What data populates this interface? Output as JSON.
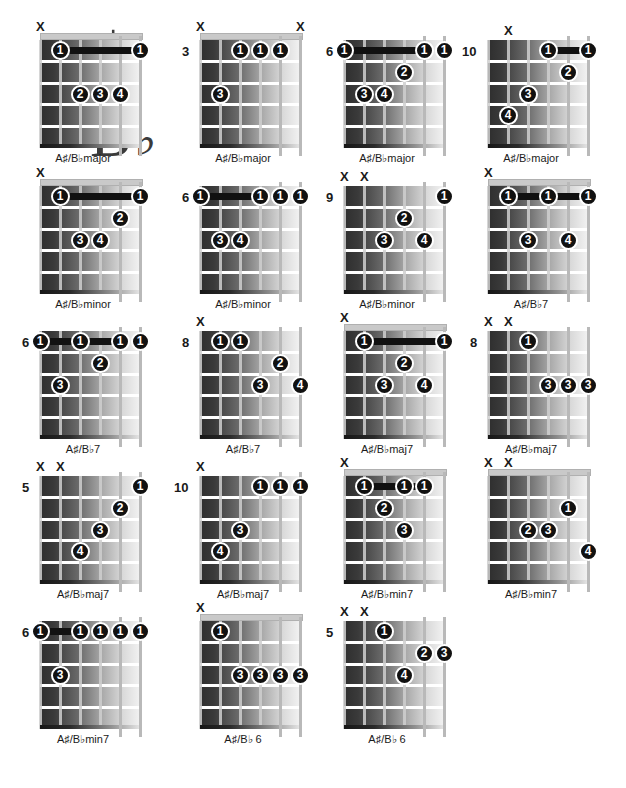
{
  "title": {
    "sharp_letter": "A",
    "sharp_symbol": "♯",
    "flat_letter": "B",
    "flat_symbol": "♭"
  },
  "legend": {
    "mute_marker": "X",
    "mute_icon_name": "string-mute-x-icon"
  },
  "chords": [
    {
      "id": "ab-major-1",
      "name": "A♯/B♭major",
      "fret_label": "",
      "open_position": true,
      "mutes": [
        1
      ],
      "barre": {
        "fret": 1,
        "from_string": 2,
        "to_string": 6
      },
      "dots": [
        {
          "string": 2,
          "fret": 1,
          "finger": "1"
        },
        {
          "string": 6,
          "fret": 1,
          "finger": "1"
        },
        {
          "string": 3,
          "fret": 3,
          "finger": "2"
        },
        {
          "string": 4,
          "fret": 3,
          "finger": "3"
        },
        {
          "string": 5,
          "fret": 3,
          "finger": "4"
        }
      ]
    },
    {
      "id": "ab-major-2",
      "name": "A♯/B♭major",
      "fret_label": "3",
      "open_position": true,
      "mutes": [
        1,
        6
      ],
      "barre": null,
      "dots": [
        {
          "string": 3,
          "fret": 1,
          "finger": "1"
        },
        {
          "string": 4,
          "fret": 1,
          "finger": "1"
        },
        {
          "string": 5,
          "fret": 1,
          "finger": "1"
        },
        {
          "string": 2,
          "fret": 3,
          "finger": "3"
        }
      ]
    },
    {
      "id": "ab-major-3",
      "name": "A♯/B♭major",
      "fret_label": "6",
      "open_position": false,
      "mutes": [],
      "barre": {
        "fret": 1,
        "from_string": 1,
        "to_string": 5
      },
      "dots": [
        {
          "string": 1,
          "fret": 1,
          "finger": "1"
        },
        {
          "string": 5,
          "fret": 1,
          "finger": "1"
        },
        {
          "string": 6,
          "fret": 1,
          "finger": "1"
        },
        {
          "string": 4,
          "fret": 2,
          "finger": "2"
        },
        {
          "string": 2,
          "fret": 3,
          "finger": "3"
        },
        {
          "string": 3,
          "fret": 3,
          "finger": "4"
        }
      ]
    },
    {
      "id": "ab-major-4",
      "name": "A♯/B♭major",
      "fret_label": "10",
      "open_position": false,
      "mutes": [
        2
      ],
      "barre": {
        "fret": 1,
        "from_string": 4,
        "to_string": 6
      },
      "dots": [
        {
          "string": 4,
          "fret": 1,
          "finger": "1"
        },
        {
          "string": 6,
          "fret": 1,
          "finger": "1"
        },
        {
          "string": 5,
          "fret": 2,
          "finger": "2"
        },
        {
          "string": 3,
          "fret": 3,
          "finger": "3"
        },
        {
          "string": 2,
          "fret": 4,
          "finger": "4"
        }
      ]
    },
    {
      "id": "ab-minor-1",
      "name": "A♯/B♭minor",
      "fret_label": "",
      "open_position": true,
      "mutes": [
        1
      ],
      "barre": {
        "fret": 1,
        "from_string": 2,
        "to_string": 6
      },
      "dots": [
        {
          "string": 2,
          "fret": 1,
          "finger": "1"
        },
        {
          "string": 6,
          "fret": 1,
          "finger": "1"
        },
        {
          "string": 5,
          "fret": 2,
          "finger": "2"
        },
        {
          "string": 3,
          "fret": 3,
          "finger": "3"
        },
        {
          "string": 4,
          "fret": 3,
          "finger": "4"
        }
      ]
    },
    {
      "id": "ab-minor-2",
      "name": "A♯/B♭minor",
      "fret_label": "6",
      "open_position": false,
      "mutes": [],
      "barre": {
        "fret": 1,
        "from_string": 1,
        "to_string": 4
      },
      "dots": [
        {
          "string": 1,
          "fret": 1,
          "finger": "1"
        },
        {
          "string": 4,
          "fret": 1,
          "finger": "1"
        },
        {
          "string": 5,
          "fret": 1,
          "finger": "1"
        },
        {
          "string": 6,
          "fret": 1,
          "finger": "1"
        },
        {
          "string": 2,
          "fret": 3,
          "finger": "3"
        },
        {
          "string": 3,
          "fret": 3,
          "finger": "4"
        }
      ]
    },
    {
      "id": "ab-minor-3",
      "name": "A♯/B♭minor",
      "fret_label": "9",
      "open_position": false,
      "mutes": [
        1,
        2
      ],
      "barre": null,
      "dots": [
        {
          "string": 6,
          "fret": 1,
          "finger": "1"
        },
        {
          "string": 4,
          "fret": 2,
          "finger": "2"
        },
        {
          "string": 3,
          "fret": 3,
          "finger": "3"
        },
        {
          "string": 5,
          "fret": 3,
          "finger": "4"
        }
      ]
    },
    {
      "id": "ab-7-1",
      "name": "A♯/B♭7",
      "fret_label": "",
      "open_position": true,
      "mutes": [
        1
      ],
      "barre": {
        "fret": 1,
        "from_string": 2,
        "to_string": 6
      },
      "dots": [
        {
          "string": 2,
          "fret": 1,
          "finger": "1"
        },
        {
          "string": 4,
          "fret": 1,
          "finger": "1"
        },
        {
          "string": 6,
          "fret": 1,
          "finger": "1"
        },
        {
          "string": 3,
          "fret": 3,
          "finger": "3"
        },
        {
          "string": 5,
          "fret": 3,
          "finger": "4"
        }
      ]
    },
    {
      "id": "ab-7-2",
      "name": "A♯/B♭7",
      "fret_label": "6",
      "open_position": false,
      "mutes": [],
      "barre": {
        "fret": 1,
        "from_string": 1,
        "to_string": 5
      },
      "dots": [
        {
          "string": 1,
          "fret": 1,
          "finger": "1"
        },
        {
          "string": 3,
          "fret": 1,
          "finger": "1"
        },
        {
          "string": 5,
          "fret": 1,
          "finger": "1"
        },
        {
          "string": 6,
          "fret": 1,
          "finger": "1"
        },
        {
          "string": 4,
          "fret": 2,
          "finger": "2"
        },
        {
          "string": 2,
          "fret": 3,
          "finger": "3"
        }
      ]
    },
    {
      "id": "ab-7-3",
      "name": "A♯/B♭7",
      "fret_label": "8",
      "open_position": false,
      "mutes": [
        1
      ],
      "barre": null,
      "dots": [
        {
          "string": 2,
          "fret": 1,
          "finger": "1"
        },
        {
          "string": 3,
          "fret": 1,
          "finger": "1"
        },
        {
          "string": 5,
          "fret": 2,
          "finger": "2"
        },
        {
          "string": 4,
          "fret": 3,
          "finger": "3"
        },
        {
          "string": 6,
          "fret": 3,
          "finger": "4"
        }
      ]
    },
    {
      "id": "ab-maj7-1",
      "name": "A♯/B♭maj7",
      "fret_label": "",
      "open_position": true,
      "mutes": [
        1
      ],
      "barre": {
        "fret": 1,
        "from_string": 2,
        "to_string": 6
      },
      "dots": [
        {
          "string": 2,
          "fret": 1,
          "finger": "1"
        },
        {
          "string": 6,
          "fret": 1,
          "finger": "1"
        },
        {
          "string": 4,
          "fret": 2,
          "finger": "2"
        },
        {
          "string": 3,
          "fret": 3,
          "finger": "3"
        },
        {
          "string": 5,
          "fret": 3,
          "finger": "4"
        }
      ]
    },
    {
      "id": "ab-maj7-2",
      "name": "A♯/B♭maj7",
      "fret_label": "8",
      "open_position": false,
      "mutes": [
        1,
        2
      ],
      "barre": null,
      "dots": [
        {
          "string": 3,
          "fret": 1,
          "finger": "1"
        },
        {
          "string": 4,
          "fret": 3,
          "finger": "3"
        },
        {
          "string": 5,
          "fret": 3,
          "finger": "3"
        },
        {
          "string": 6,
          "fret": 3,
          "finger": "3"
        }
      ]
    },
    {
      "id": "ab-maj7-3",
      "name": "A♯/B♭maj7",
      "fret_label": "5",
      "open_position": false,
      "mutes": [
        1,
        2
      ],
      "barre": null,
      "dots": [
        {
          "string": 6,
          "fret": 1,
          "finger": "1"
        },
        {
          "string": 5,
          "fret": 2,
          "finger": "2"
        },
        {
          "string": 4,
          "fret": 3,
          "finger": "3"
        },
        {
          "string": 3,
          "fret": 4,
          "finger": "4"
        }
      ]
    },
    {
      "id": "ab-maj7-4",
      "name": "A♯/B♭maj7",
      "fret_label": "10",
      "open_position": false,
      "mutes": [
        1
      ],
      "barre": null,
      "dots": [
        {
          "string": 4,
          "fret": 1,
          "finger": "1"
        },
        {
          "string": 5,
          "fret": 1,
          "finger": "1"
        },
        {
          "string": 6,
          "fret": 1,
          "finger": "1"
        },
        {
          "string": 3,
          "fret": 3,
          "finger": "3"
        },
        {
          "string": 2,
          "fret": 4,
          "finger": "4"
        }
      ]
    },
    {
      "id": "ab-min7-1",
      "name": "A♯/B♭min7",
      "fret_label": "",
      "open_position": true,
      "mutes": [
        1
      ],
      "barre": {
        "fret": 1,
        "from_string": 2,
        "to_string": 5
      },
      "dots": [
        {
          "string": 2,
          "fret": 1,
          "finger": "1"
        },
        {
          "string": 4,
          "fret": 1,
          "finger": "1"
        },
        {
          "string": 5,
          "fret": 1,
          "finger": "1"
        },
        {
          "string": 3,
          "fret": 2,
          "finger": "2"
        },
        {
          "string": 4,
          "fret": 3,
          "finger": "3"
        }
      ]
    },
    {
      "id": "ab-min7-2",
      "name": "A♯/B♭min7",
      "fret_label": "",
      "open_position": true,
      "mutes": [
        1,
        2
      ],
      "barre": null,
      "dots": [
        {
          "string": 5,
          "fret": 2,
          "finger": "1"
        },
        {
          "string": 3,
          "fret": 3,
          "finger": "2"
        },
        {
          "string": 4,
          "fret": 3,
          "finger": "3"
        },
        {
          "string": 6,
          "fret": 4,
          "finger": "4"
        }
      ]
    },
    {
      "id": "ab-min7-3",
      "name": "A♯/B♭min7",
      "fret_label": "6",
      "open_position": false,
      "mutes": [],
      "barre": {
        "fret": 1,
        "from_string": 1,
        "to_string": 3
      },
      "dots": [
        {
          "string": 1,
          "fret": 1,
          "finger": "1"
        },
        {
          "string": 3,
          "fret": 1,
          "finger": "1"
        },
        {
          "string": 4,
          "fret": 1,
          "finger": "1"
        },
        {
          "string": 5,
          "fret": 1,
          "finger": "1"
        },
        {
          "string": 6,
          "fret": 1,
          "finger": "1"
        },
        {
          "string": 2,
          "fret": 3,
          "finger": "3"
        }
      ]
    },
    {
      "id": "ab-6-1",
      "name": "A♯/B♭ 6",
      "fret_label": "",
      "open_position": true,
      "mutes": [
        1
      ],
      "barre": null,
      "dots": [
        {
          "string": 2,
          "fret": 1,
          "finger": "1"
        },
        {
          "string": 3,
          "fret": 3,
          "finger": "3"
        },
        {
          "string": 4,
          "fret": 3,
          "finger": "3"
        },
        {
          "string": 5,
          "fret": 3,
          "finger": "3"
        },
        {
          "string": 6,
          "fret": 3,
          "finger": "3"
        }
      ]
    },
    {
      "id": "ab-6-2",
      "name": "A♯/B♭ 6",
      "fret_label": "5",
      "open_position": false,
      "mutes": [
        1,
        2
      ],
      "barre": null,
      "dots": [
        {
          "string": 3,
          "fret": 1,
          "finger": "1"
        },
        {
          "string": 5,
          "fret": 2,
          "finger": "2"
        },
        {
          "string": 6,
          "fret": 2,
          "finger": "3"
        },
        {
          "string": 4,
          "fret": 3,
          "finger": "4"
        }
      ]
    }
  ]
}
